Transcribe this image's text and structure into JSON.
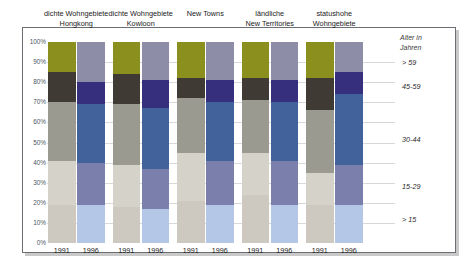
{
  "chart_data": {
    "type": "bar",
    "title": "",
    "subtitle": "",
    "xlabel": "",
    "ylabel": "",
    "ylim": [
      0,
      100
    ],
    "stacked": true,
    "stack_percent": true,
    "grid": true,
    "legend_position": "right",
    "legend_title_line1": "Alter in",
    "legend_title_line2": "Jahren",
    "ytick_labels": [
      "100%",
      "90%",
      "80%",
      "70%",
      "60%",
      "50%",
      "40%",
      "30%",
      "20%",
      "10%",
      "0%"
    ],
    "ytick_values": [
      100,
      90,
      80,
      70,
      60,
      50,
      40,
      30,
      20,
      10,
      0
    ],
    "categories": [
      "1991",
      "1996",
      "1991",
      "1996",
      "1991",
      "1996",
      "1991",
      "1996",
      "1991",
      "1996"
    ],
    "groups": [
      {
        "line1": "dichte Wohngebiete",
        "line2": "Hongkong",
        "bars": [
          0,
          1
        ]
      },
      {
        "line1": "dichte Wohngebiete",
        "line2": "Kowloon",
        "bars": [
          2,
          3
        ]
      },
      {
        "line1": "New Towns",
        "line2": "",
        "bars": [
          4,
          5
        ]
      },
      {
        "line1": "ländliche",
        "line2": "New Territories",
        "bars": [
          6,
          7
        ]
      },
      {
        "line1": "statushohe",
        "line2": "Wohngebiete",
        "bars": [
          8,
          9
        ]
      }
    ],
    "series": [
      {
        "name": "> 15",
        "legend_label": "> 15",
        "color_1991": "#cdc9c0",
        "color_1996": "#b4c7e7",
        "values": [
          19,
          19,
          18,
          17,
          21,
          19,
          24,
          19,
          19,
          19
        ]
      },
      {
        "name": "15-29",
        "legend_label": "15-29",
        "color_1991": "#d5d2ca",
        "color_1996": "#7b7fab",
        "values": [
          22,
          21,
          21,
          20,
          24,
          22,
          21,
          22,
          16,
          20
        ]
      },
      {
        "name": "30-44",
        "legend_label": "30-44",
        "color_1991": "#9b9a91",
        "color_1996": "#41629b",
        "values": [
          29,
          29,
          30,
          30,
          27,
          29,
          26,
          29,
          31,
          35
        ]
      },
      {
        "name": "45-59",
        "legend_label": "45-59",
        "color_1991": "#3f3b34",
        "color_1996": "#352f7e",
        "values": [
          15,
          11,
          15,
          14,
          10,
          11,
          11,
          11,
          16,
          11
        ]
      },
      {
        "name": "> 59",
        "legend_label": "> 59",
        "color_1991": "#8b8f1e",
        "color_1996": "#8d8da8",
        "values": [
          15,
          20,
          16,
          19,
          18,
          19,
          18,
          19,
          18,
          15
        ]
      }
    ],
    "legend_entries": [
      {
        "label": "> 59",
        "color": "#8d8da8"
      },
      {
        "label": "45-59",
        "color": "#352f7e"
      },
      {
        "label": "30-44",
        "color": "#41629b"
      },
      {
        "label": "15-29",
        "color": "#7b7fab"
      },
      {
        "label": "> 15",
        "color": "#b4c7e7"
      }
    ]
  }
}
